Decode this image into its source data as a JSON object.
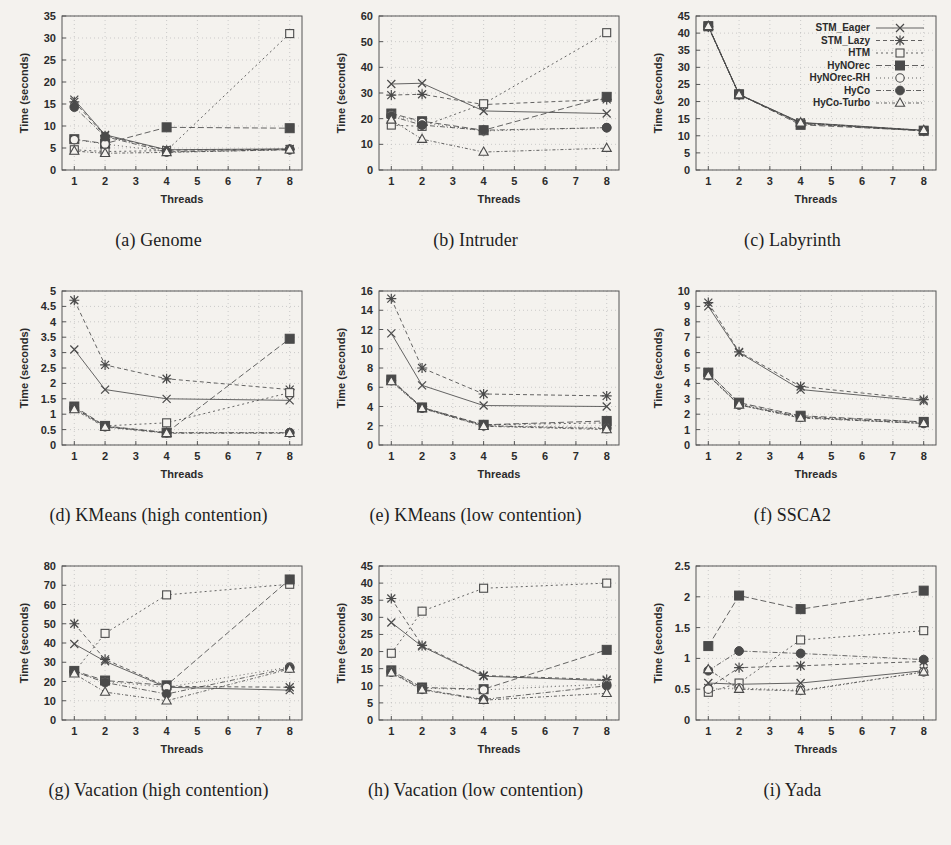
{
  "figure": {
    "shared_xlabel": "Threads",
    "shared_ylabel": "Time (seconds)",
    "x_categories": [
      1,
      2,
      3,
      4,
      5,
      6,
      7,
      8
    ],
    "x_data_points": [
      1,
      2,
      4,
      8
    ],
    "series_names": [
      "STM_Eager",
      "STM_Lazy",
      "HTM",
      "HyNOrec",
      "HyNOrec-RH",
      "HyCo",
      "HyCo-Turbo"
    ],
    "series_markers": [
      "cross",
      "star",
      "open-square",
      "filled-square",
      "open-circle",
      "filled-circle",
      "open-triangle"
    ],
    "legend_panel": "c",
    "legend_position": "top-right",
    "ink_color": "#4a4a4a",
    "background_color": "#f4f2ee"
  },
  "chart_data": [
    {
      "type": "line",
      "panel": "a",
      "title": "(a) Genome",
      "xlabel": "Threads",
      "ylabel": "Time (seconds)",
      "x": [
        1,
        2,
        4,
        8
      ],
      "xlim": [
        0.6,
        8.4
      ],
      "xticks": [
        1,
        2,
        3,
        4,
        5,
        6,
        7,
        8
      ],
      "ylim": [
        0,
        35
      ],
      "yticks": [
        0,
        5,
        10,
        15,
        20,
        25,
        30,
        35
      ],
      "grid": true,
      "legend": false,
      "series": [
        {
          "name": "STM_Eager",
          "marker": "cross",
          "values": [
            16.0,
            8.0,
            4.6,
            4.8
          ]
        },
        {
          "name": "STM_Lazy",
          "marker": "star",
          "values": [
            15.5,
            7.8,
            4.5,
            4.7
          ]
        },
        {
          "name": "HTM",
          "marker": "open-square",
          "values": [
            4.6,
            4.2,
            4.4,
            31.0
          ]
        },
        {
          "name": "HyNOrec",
          "marker": "filled-square",
          "values": [
            7.0,
            6.0,
            9.7,
            9.5
          ]
        },
        {
          "name": "HyNOrec-RH",
          "marker": "open-circle",
          "values": [
            6.9,
            5.9,
            4.2,
            4.8
          ]
        },
        {
          "name": "HyCo",
          "marker": "filled-circle",
          "values": [
            14.3,
            7.6,
            4.1,
            4.6
          ]
        },
        {
          "name": "HyCo-Turbo",
          "marker": "open-triangle",
          "values": [
            4.3,
            3.8,
            4.0,
            4.6
          ]
        }
      ]
    },
    {
      "type": "line",
      "panel": "b",
      "title": "(b) Intruder",
      "xlabel": "Threads",
      "ylabel": "Time (seconds)",
      "x": [
        1,
        2,
        4,
        8
      ],
      "xlim": [
        0.6,
        8.4
      ],
      "xticks": [
        1,
        2,
        3,
        4,
        5,
        6,
        7,
        8
      ],
      "ylim": [
        0,
        60
      ],
      "yticks": [
        0,
        10,
        20,
        30,
        40,
        50,
        60
      ],
      "grid": true,
      "legend": false,
      "series": [
        {
          "name": "STM_Eager",
          "marker": "cross",
          "values": [
            33.5,
            33.8,
            23.0,
            22.0
          ]
        },
        {
          "name": "STM_Lazy",
          "marker": "star",
          "values": [
            29.2,
            29.5,
            25.5,
            27.5
          ]
        },
        {
          "name": "HTM",
          "marker": "open-square",
          "values": [
            17.5,
            17.0,
            25.8,
            53.5
          ]
        },
        {
          "name": "HyNOrec",
          "marker": "filled-square",
          "values": [
            22.0,
            19.0,
            15.5,
            28.5
          ]
        },
        {
          "name": "HyNOrec-RH",
          "marker": "open-circle",
          "values": [
            21.5,
            18.5,
            15.2,
            16.5
          ]
        },
        {
          "name": "HyCo",
          "marker": "filled-circle",
          "values": [
            21.0,
            17.5,
            15.5,
            16.5
          ]
        },
        {
          "name": "HyCo-Turbo",
          "marker": "open-triangle",
          "values": [
            19.5,
            12.0,
            7.0,
            8.5
          ]
        }
      ]
    },
    {
      "type": "line",
      "panel": "c",
      "title": "(c) Labyrinth",
      "xlabel": "Threads",
      "ylabel": "Time (seconds)",
      "x": [
        1,
        2,
        4,
        8
      ],
      "xlim": [
        0.6,
        8.4
      ],
      "xticks": [
        1,
        2,
        3,
        4,
        5,
        6,
        7,
        8
      ],
      "ylim": [
        0,
        45
      ],
      "yticks": [
        0,
        5,
        10,
        15,
        20,
        25,
        30,
        35,
        40,
        45
      ],
      "grid": true,
      "legend": true,
      "series": [
        {
          "name": "STM_Eager",
          "marker": "cross",
          "values": [
            42.0,
            22.1,
            13.9,
            11.6
          ]
        },
        {
          "name": "STM_Lazy",
          "marker": "star",
          "values": [
            41.8,
            22.0,
            13.8,
            11.5
          ]
        },
        {
          "name": "HTM",
          "marker": "open-square",
          "values": [
            42.1,
            22.2,
            13.7,
            11.4
          ]
        },
        {
          "name": "HyNOrec",
          "marker": "filled-square",
          "values": [
            42.0,
            22.1,
            13.2,
            11.5
          ]
        },
        {
          "name": "HyNOrec-RH",
          "marker": "open-circle",
          "values": [
            41.9,
            22.0,
            13.6,
            11.5
          ]
        },
        {
          "name": "HyCo",
          "marker": "filled-circle",
          "values": [
            42.0,
            22.1,
            13.5,
            11.5
          ]
        },
        {
          "name": "HyCo-Turbo",
          "marker": "open-triangle",
          "values": [
            42.0,
            22.0,
            13.8,
            11.6
          ]
        }
      ]
    },
    {
      "type": "line",
      "panel": "d",
      "title": "(d) KMeans (high contention)",
      "xlabel": "Threads",
      "ylabel": "Time (seconds)",
      "x": [
        1,
        2,
        4,
        8
      ],
      "xlim": [
        0.6,
        8.4
      ],
      "xticks": [
        1,
        2,
        3,
        4,
        5,
        6,
        7,
        8
      ],
      "ylim": [
        0,
        5
      ],
      "yticks": [
        0,
        0.5,
        1,
        1.5,
        2,
        2.5,
        3,
        3.5,
        4,
        4.5,
        5
      ],
      "grid": true,
      "legend": false,
      "series": [
        {
          "name": "STM_Eager",
          "marker": "cross",
          "values": [
            3.1,
            1.8,
            1.5,
            1.45
          ]
        },
        {
          "name": "STM_Lazy",
          "marker": "star",
          "values": [
            4.7,
            2.6,
            2.15,
            1.8
          ]
        },
        {
          "name": "HTM",
          "marker": "open-square",
          "values": [
            1.2,
            0.62,
            0.72,
            1.7
          ]
        },
        {
          "name": "HyNOrec",
          "marker": "filled-square",
          "values": [
            1.25,
            0.62,
            0.4,
            3.45
          ]
        },
        {
          "name": "HyNOrec-RH",
          "marker": "open-circle",
          "values": [
            1.22,
            0.6,
            0.4,
            0.4
          ]
        },
        {
          "name": "HyCo",
          "marker": "filled-circle",
          "values": [
            1.2,
            0.6,
            0.4,
            0.4
          ]
        },
        {
          "name": "HyCo-Turbo",
          "marker": "open-triangle",
          "values": [
            1.15,
            0.58,
            0.38,
            0.38
          ]
        }
      ]
    },
    {
      "type": "line",
      "panel": "e",
      "title": "(e) KMeans (low contention)",
      "xlabel": "Threads",
      "ylabel": "Time (seconds)",
      "x": [
        1,
        2,
        4,
        8
      ],
      "xlim": [
        0.6,
        8.4
      ],
      "xticks": [
        1,
        2,
        3,
        4,
        5,
        6,
        7,
        8
      ],
      "ylim": [
        0,
        16
      ],
      "yticks": [
        0,
        2,
        4,
        6,
        8,
        10,
        12,
        14,
        16
      ],
      "grid": true,
      "legend": false,
      "series": [
        {
          "name": "STM_Eager",
          "marker": "cross",
          "values": [
            11.6,
            6.2,
            4.1,
            4.0
          ]
        },
        {
          "name": "STM_Lazy",
          "marker": "star",
          "values": [
            15.2,
            8.0,
            5.3,
            5.1
          ]
        },
        {
          "name": "HTM",
          "marker": "open-square",
          "values": [
            6.7,
            3.9,
            2.1,
            2.3
          ]
        },
        {
          "name": "HyNOrec",
          "marker": "filled-square",
          "values": [
            6.8,
            3.9,
            2.1,
            2.5
          ]
        },
        {
          "name": "HyNOrec-RH",
          "marker": "open-circle",
          "values": [
            6.7,
            3.85,
            2.0,
            1.8
          ]
        },
        {
          "name": "HyCo",
          "marker": "filled-circle",
          "values": [
            6.7,
            3.85,
            2.0,
            1.7
          ]
        },
        {
          "name": "HyCo-Turbo",
          "marker": "open-triangle",
          "values": [
            6.6,
            3.8,
            1.95,
            1.6
          ]
        }
      ]
    },
    {
      "type": "line",
      "panel": "f",
      "title": "(f) SSCA2",
      "xlabel": "Threads",
      "ylabel": "Time (seconds)",
      "x": [
        1,
        2,
        4,
        8
      ],
      "xlim": [
        0.6,
        8.4
      ],
      "xticks": [
        1,
        2,
        3,
        4,
        5,
        6,
        7,
        8
      ],
      "ylim": [
        0,
        10
      ],
      "yticks": [
        0,
        1,
        2,
        3,
        4,
        5,
        6,
        7,
        8,
        9,
        10
      ],
      "grid": true,
      "legend": false,
      "series": [
        {
          "name": "STM_Eager",
          "marker": "cross",
          "values": [
            9.0,
            6.0,
            3.6,
            2.85
          ]
        },
        {
          "name": "STM_Lazy",
          "marker": "star",
          "values": [
            9.25,
            6.05,
            3.8,
            2.95
          ]
        },
        {
          "name": "HTM",
          "marker": "open-square",
          "values": [
            4.7,
            2.7,
            1.85,
            1.5
          ]
        },
        {
          "name": "HyNOrec",
          "marker": "filled-square",
          "values": [
            4.7,
            2.75,
            1.9,
            1.5
          ]
        },
        {
          "name": "HyNOrec-RH",
          "marker": "open-circle",
          "values": [
            4.5,
            2.65,
            1.8,
            1.45
          ]
        },
        {
          "name": "HyCo",
          "marker": "filled-circle",
          "values": [
            4.55,
            2.6,
            1.8,
            1.4
          ]
        },
        {
          "name": "HyCo-Turbo",
          "marker": "open-triangle",
          "values": [
            4.5,
            2.6,
            1.75,
            1.4
          ]
        }
      ]
    },
    {
      "type": "line",
      "panel": "g",
      "title": "(g) Vacation (high contention)",
      "xlabel": "Threads",
      "ylabel": "Time (seconds)",
      "x": [
        1,
        2,
        4,
        8
      ],
      "xlim": [
        0.6,
        8.4
      ],
      "xticks": [
        1,
        2,
        3,
        4,
        5,
        6,
        7,
        8
      ],
      "ylim": [
        0,
        80
      ],
      "yticks": [
        0,
        10,
        20,
        30,
        40,
        50,
        60,
        70,
        80
      ],
      "grid": true,
      "legend": false,
      "series": [
        {
          "name": "STM_Eager",
          "marker": "cross",
          "values": [
            39.5,
            30.5,
            17.0,
            15.5
          ]
        },
        {
          "name": "STM_Lazy",
          "marker": "star",
          "values": [
            50.0,
            31.5,
            17.5,
            17.0
          ]
        },
        {
          "name": "HTM",
          "marker": "open-square",
          "values": [
            25.0,
            45.0,
            65.0,
            70.5
          ]
        },
        {
          "name": "HyNOrec",
          "marker": "filled-square",
          "values": [
            25.5,
            20.5,
            18.0,
            73.0
          ]
        },
        {
          "name": "HyNOrec-RH",
          "marker": "open-circle",
          "values": [
            25.0,
            20.0,
            17.0,
            27.5
          ]
        },
        {
          "name": "HyCo",
          "marker": "filled-circle",
          "values": [
            25.2,
            19.5,
            13.5,
            27.0
          ]
        },
        {
          "name": "HyCo-Turbo",
          "marker": "open-triangle",
          "values": [
            24.0,
            14.5,
            10.0,
            26.5
          ]
        }
      ]
    },
    {
      "type": "line",
      "panel": "h",
      "title": "(h) Vacation (low contention)",
      "xlabel": "Threads",
      "ylabel": "Time (seconds)",
      "x": [
        1,
        2,
        4,
        8
      ],
      "xlim": [
        0.6,
        8.4
      ],
      "xticks": [
        1,
        2,
        3,
        4,
        5,
        6,
        7,
        8
      ],
      "ylim": [
        0,
        45
      ],
      "yticks": [
        0,
        5,
        10,
        15,
        20,
        25,
        30,
        35,
        40,
        45
      ],
      "grid": true,
      "legend": false,
      "series": [
        {
          "name": "STM_Eager",
          "marker": "cross",
          "values": [
            28.5,
            21.5,
            12.8,
            11.5
          ]
        },
        {
          "name": "STM_Lazy",
          "marker": "star",
          "values": [
            35.5,
            21.8,
            13.0,
            11.8
          ]
        },
        {
          "name": "HTM",
          "marker": "open-square",
          "values": [
            19.5,
            31.8,
            38.5,
            40.0
          ]
        },
        {
          "name": "HyNOrec",
          "marker": "filled-square",
          "values": [
            14.5,
            9.5,
            9.0,
            20.5
          ]
        },
        {
          "name": "HyNOrec-RH",
          "marker": "open-circle",
          "values": [
            14.3,
            9.3,
            8.8,
            10.5
          ]
        },
        {
          "name": "HyCo",
          "marker": "filled-circle",
          "values": [
            14.0,
            9.0,
            6.0,
            10.0
          ]
        },
        {
          "name": "HyCo-Turbo",
          "marker": "open-triangle",
          "values": [
            13.8,
            8.8,
            5.8,
            7.8
          ]
        }
      ]
    },
    {
      "type": "line",
      "panel": "i",
      "title": "(i) Yada",
      "xlabel": "Threads",
      "ylabel": "Time (seconds)",
      "x": [
        1,
        2,
        4,
        8
      ],
      "xlim": [
        0.6,
        8.4
      ],
      "xticks": [
        1,
        2,
        3,
        4,
        5,
        6,
        7,
        8
      ],
      "ylim": [
        0,
        2.5
      ],
      "yticks": [
        0,
        0.5,
        1,
        1.5,
        2,
        2.5
      ],
      "grid": true,
      "legend": false,
      "series": [
        {
          "name": "STM_Eager",
          "marker": "cross",
          "values": [
            0.6,
            0.58,
            0.6,
            0.8
          ]
        },
        {
          "name": "STM_Lazy",
          "marker": "star",
          "values": [
            0.52,
            0.85,
            0.88,
            0.95
          ]
        },
        {
          "name": "HTM",
          "marker": "open-square",
          "values": [
            0.45,
            0.6,
            1.3,
            1.45
          ]
        },
        {
          "name": "HyNOrec",
          "marker": "filled-square",
          "values": [
            1.2,
            2.02,
            1.8,
            2.1
          ]
        },
        {
          "name": "HyNOrec-RH",
          "marker": "open-circle",
          "values": [
            0.5,
            0.52,
            0.48,
            0.78
          ]
        },
        {
          "name": "HyCo",
          "marker": "filled-circle",
          "values": [
            0.8,
            1.12,
            1.08,
            0.98
          ]
        },
        {
          "name": "HyCo-Turbo",
          "marker": "open-triangle",
          "values": [
            0.82,
            0.5,
            0.47,
            0.78
          ]
        }
      ]
    }
  ]
}
